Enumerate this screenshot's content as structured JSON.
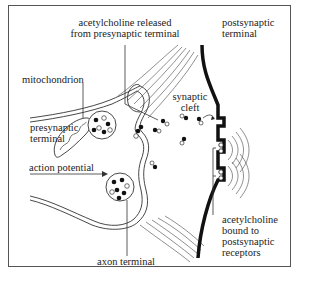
{
  "diagram": {
    "type": "synapse-illustration",
    "labels": {
      "ach_released_line1": "acetylcholine released",
      "ach_released_line2": "from presynaptic terminal",
      "postsynaptic_line1": "postsynaptic",
      "postsynaptic_line2": "terminal",
      "mitochondrion": "mitochondrion",
      "presynaptic_line1": "presynaptic",
      "presynaptic_line2": "terminal",
      "synaptic_cleft_line1": "synaptic",
      "synaptic_cleft_line2": "cleft",
      "action_potential": "action potential",
      "axon_terminal": "axon terminal",
      "ach_bound_line1": "acetylcholine",
      "ach_bound_line2": "bound to",
      "ach_bound_line3": "postsynaptic",
      "ach_bound_line4": "receptors"
    },
    "colors": {
      "line": "#222222",
      "membrane_post": "#111111",
      "frame": "#555555",
      "background": "#ffffff"
    }
  }
}
